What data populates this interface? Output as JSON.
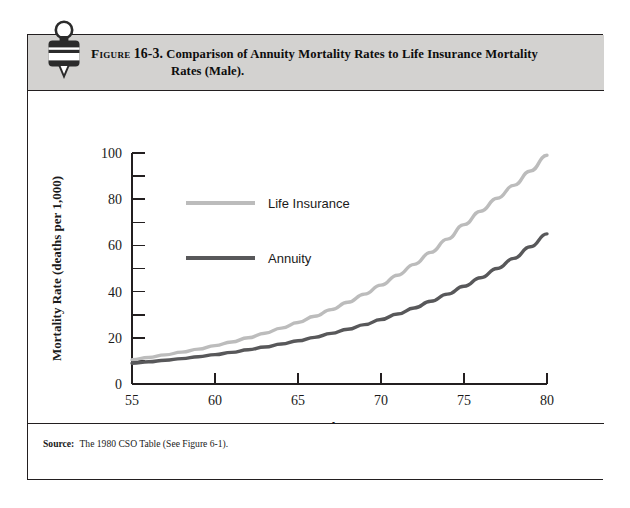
{
  "figure": {
    "label_word": "Figure",
    "number": "16-3.",
    "title_line1": "Comparison of Annuity Mortality Rates to Life Insurance Mortality",
    "title_line2": "Rates (Male).",
    "icon": "seal-badge-icon",
    "banner_color": "#d3d2d0",
    "border_color": "#231f20"
  },
  "source": {
    "label": "Source:",
    "text": "The 1980 CSO Table (See Figure 6-1)."
  },
  "chart_data": {
    "type": "line",
    "title": "Comparison of Annuity Mortality Rates to Life Insurance Mortality Rates (Male).",
    "xlabel": "Age",
    "ylabel": "Mortality Rate (deaths per 1,000)",
    "xlim": [
      55,
      80
    ],
    "ylim": [
      0,
      100
    ],
    "xticks": [
      55,
      60,
      65,
      70,
      75,
      80
    ],
    "xtick_labels": [
      "55",
      "60",
      "65",
      "70",
      "75",
      "80"
    ],
    "yticks": [
      0,
      20,
      40,
      60,
      80,
      100
    ],
    "ytick_labels": [
      "0",
      "20",
      "40",
      "60",
      "80",
      "100"
    ],
    "yminor_ticks": [
      10,
      30,
      50,
      70,
      90
    ],
    "grid": false,
    "legend_position": "inside-upper-left",
    "x": [
      55,
      56,
      57,
      58,
      59,
      60,
      61,
      62,
      63,
      64,
      65,
      66,
      67,
      68,
      69,
      70,
      71,
      72,
      73,
      74,
      75,
      76,
      77,
      78,
      79,
      80
    ],
    "series": [
      {
        "name": "Life Insurance",
        "color": "#bcbcbc",
        "values": [
          10.5,
          11.5,
          12.6,
          13.8,
          15.1,
          16.6,
          18.2,
          20.0,
          22.0,
          24.2,
          26.6,
          29.3,
          32.2,
          35.4,
          38.9,
          42.8,
          47.1,
          51.8,
          57.0,
          62.7,
          69.0,
          74.8,
          80.4,
          86.0,
          92.2,
          99.0
        ]
      },
      {
        "name": "Annuity",
        "color": "#58585a",
        "values": [
          9.0,
          9.6,
          10.3,
          11.0,
          11.8,
          12.7,
          13.7,
          14.8,
          16.0,
          17.3,
          18.7,
          20.2,
          21.9,
          23.7,
          25.7,
          27.9,
          30.3,
          32.9,
          35.8,
          38.9,
          42.3,
          46.0,
          50.0,
          54.4,
          59.4,
          65.0
        ]
      }
    ]
  }
}
